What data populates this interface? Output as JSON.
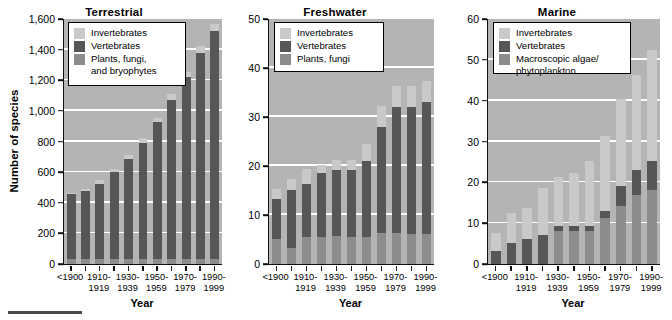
{
  "figure": {
    "y_axis_title": "Number of species",
    "x_axis_title": "Year",
    "colors": {
      "invertebrates": "#c9c9c9",
      "vertebrates": "#565656",
      "plants": "#8c8c8c",
      "plot_background": "#b4b4b4",
      "gridline": "#ffffff",
      "axis": "#111111"
    },
    "footer_rule_color": "#4a4a4a"
  },
  "chart_data": [
    {
      "type": "bar",
      "title": "Terrestrial",
      "xlabel": "Year",
      "ylabel": "Number of species",
      "ylim": [
        0,
        1600
      ],
      "yticks": [
        0,
        200,
        400,
        600,
        800,
        1000,
        1200,
        1400,
        1600
      ],
      "ytick_labels": [
        "0",
        "200",
        "400",
        "600",
        "800",
        "1,000",
        "1,200",
        "1,400",
        "1,600"
      ],
      "grid": true,
      "stacked": true,
      "legend_position": "upper left",
      "categories": [
        "<1900",
        "",
        "1910-\n1919",
        "",
        "1930-\n1939",
        "",
        "1950-\n1959",
        "",
        "1970-\n1979",
        "",
        "1990-\n1999"
      ],
      "bar_labels": [
        "<1900",
        "1910-\n1919",
        "1930-\n1939",
        "1950-\n1959",
        "1970-\n1979",
        "1990-\n1999"
      ],
      "x": [
        "<1900",
        "1910-1919",
        "1930-1939",
        "1950-1959",
        "1970-1979",
        "1990-1999"
      ],
      "series": [
        {
          "name": "Plants, fungi, and bryophytes",
          "values": [
            30,
            30,
            30,
            30,
            30,
            30,
            30,
            30
          ]
        },
        {
          "name": "Vertebrates",
          "values": [
            425,
            455,
            505,
            580,
            660,
            765,
            900,
            1035
          ]
        },
        {
          "name": "Invertebrates",
          "values": [
            10,
            10,
            25,
            30,
            30,
            35,
            40,
            45
          ]
        }
      ],
      "bar_x_values": [
        "<1900",
        "1905-1909",
        "1910-1919",
        "1920-1929",
        "1930-1939",
        "1940-1949",
        "1950-1959",
        "1960-1969"
      ],
      "bars": [
        {
          "label": "<1900",
          "plants": 30,
          "vertebrates": 425,
          "invertebrates": 10,
          "total": 465
        },
        {
          "label": "",
          "plants": 30,
          "vertebrates": 450,
          "invertebrates": 10,
          "total": 490
        },
        {
          "label": "1910-1919",
          "plants": 30,
          "vertebrates": 495,
          "invertebrates": 25,
          "total": 550
        },
        {
          "label": "",
          "plants": 30,
          "vertebrates": 570,
          "invertebrates": 20,
          "total": 620
        },
        {
          "label": "1930-1939",
          "plants": 30,
          "vertebrates": 655,
          "invertebrates": 25,
          "total": 710
        },
        {
          "label": "",
          "plants": 30,
          "vertebrates": 760,
          "invertebrates": 35,
          "total": 825
        },
        {
          "label": "1950-1959",
          "plants": 30,
          "vertebrates": 900,
          "invertebrates": 25,
          "total": 955
        },
        {
          "label": "",
          "plants": 30,
          "vertebrates": 1040,
          "invertebrates": 40,
          "total": 1110
        },
        {
          "label": "1970-1979",
          "plants": 30,
          "vertebrates": 1190,
          "invertebrates": 35,
          "total": 1255
        },
        {
          "label": "",
          "plants": 30,
          "vertebrates": 1350,
          "invertebrates": 45,
          "total": 1425
        },
        {
          "label": "1990-1999",
          "plants": 30,
          "vertebrates": 1490,
          "invertebrates": 45,
          "total": 1565
        }
      ],
      "legend": [
        {
          "key": "invertebrates",
          "label": "Invertebrates"
        },
        {
          "key": "vertebrates",
          "label": "Vertebrates"
        },
        {
          "key": "plants",
          "label": "Plants, fungi,\nand bryophytes"
        }
      ]
    },
    {
      "type": "bar",
      "title": "Freshwater",
      "xlabel": "Year",
      "ylabel": "",
      "ylim": [
        0,
        50
      ],
      "yticks": [
        0,
        10,
        20,
        30,
        40,
        50
      ],
      "ytick_labels": [
        "0",
        "10",
        "20",
        "30",
        "40",
        "50"
      ],
      "grid": true,
      "stacked": true,
      "legend_position": "upper left",
      "bar_labels": [
        "<1900",
        "1910-\n1919",
        "1930-\n1939",
        "1950-\n1959",
        "1970-\n1979",
        "1990-\n1999"
      ],
      "bars": [
        {
          "label": "<1900",
          "plants": 5.2,
          "vertebrates": 8.0,
          "invertebrates": 2.2,
          "total": 15.4
        },
        {
          "label": "",
          "plants": 3.2,
          "vertebrates": 11.9,
          "invertebrates": 2.3,
          "total": 17.4
        },
        {
          "label": "1910-1919",
          "plants": 5.5,
          "vertebrates": 10.8,
          "invertebrates": 3.1,
          "total": 19.4
        },
        {
          "label": "",
          "plants": 5.6,
          "vertebrates": 12.9,
          "invertebrates": 1.8,
          "total": 20.3
        },
        {
          "label": "1930-1939",
          "plants": 5.7,
          "vertebrates": 13.4,
          "invertebrates": 2.1,
          "total": 21.2
        },
        {
          "label": "",
          "plants": 5.6,
          "vertebrates": 13.5,
          "invertebrates": 2.1,
          "total": 21.2
        },
        {
          "label": "1950-1959",
          "plants": 5.5,
          "vertebrates": 15.5,
          "invertebrates": 3.4,
          "total": 24.4
        },
        {
          "label": "",
          "plants": 6.4,
          "vertebrates": 21.6,
          "invertebrates": 4.2,
          "total": 32.2
        },
        {
          "label": "1970-1979",
          "plants": 6.3,
          "vertebrates": 25.7,
          "invertebrates": 4.3,
          "total": 36.3
        },
        {
          "label": "",
          "plants": 6.2,
          "vertebrates": 25.9,
          "invertebrates": 4.2,
          "total": 36.3
        },
        {
          "label": "1990-1999",
          "plants": 6.2,
          "vertebrates": 26.9,
          "invertebrates": 4.3,
          "total": 37.4
        }
      ],
      "legend": [
        {
          "key": "invertebrates",
          "label": "Invertebrates"
        },
        {
          "key": "vertebrates",
          "label": "Vertebrates"
        },
        {
          "key": "plants",
          "label": "Plants, fungi"
        }
      ]
    },
    {
      "type": "bar",
      "title": "Marine",
      "xlabel": "Year",
      "ylabel": "",
      "ylim": [
        0,
        60
      ],
      "yticks": [
        0,
        10,
        20,
        30,
        40,
        50,
        60
      ],
      "ytick_labels": [
        "0",
        "10",
        "20",
        "30",
        "40",
        "50",
        "60"
      ],
      "grid": true,
      "stacked": true,
      "legend_position": "upper left",
      "bar_labels": [
        "<1900",
        "1910-\n1919",
        "1930-\n1939",
        "1950-\n1959",
        "1970-\n1979",
        "1990-\n1999"
      ],
      "bars": [
        {
          "label": "<1900",
          "plants": 0.0,
          "vertebrates": 3.2,
          "invertebrates": 4.3,
          "total": 7.5
        },
        {
          "label": "",
          "plants": 0.0,
          "vertebrates": 5.1,
          "invertebrates": 7.4,
          "total": 12.5
        },
        {
          "label": "1910-1919",
          "plants": 0.0,
          "vertebrates": 6.2,
          "invertebrates": 7.4,
          "total": 13.6
        },
        {
          "label": "",
          "plants": 0.0,
          "vertebrates": 7.1,
          "invertebrates": 11.4,
          "total": 18.5
        },
        {
          "label": "1930-1939",
          "plants": 8.2,
          "vertebrates": 1.1,
          "invertebrates": 12.1,
          "total": 21.4
        },
        {
          "label": "",
          "plants": 8.2,
          "vertebrates": 1.0,
          "invertebrates": 13.2,
          "total": 22.4
        },
        {
          "label": "1950-1959",
          "plants": 8.2,
          "vertebrates": 1.0,
          "invertebrates": 16.1,
          "total": 25.3
        },
        {
          "label": "",
          "plants": 11.2,
          "vertebrates": 1.8,
          "invertebrates": 18.4,
          "total": 31.4
        },
        {
          "label": "1970-1979",
          "plants": 14.1,
          "vertebrates": 5.0,
          "invertebrates": 21.3,
          "total": 40.4
        },
        {
          "label": "",
          "plants": 17.0,
          "vertebrates": 6.1,
          "invertebrates": 23.3,
          "total": 46.4
        },
        {
          "label": "1990-1999",
          "plants": 18.2,
          "vertebrates": 7.0,
          "invertebrates": 27.2,
          "total": 52.4
        }
      ],
      "legend": [
        {
          "key": "invertebrates",
          "label": "Invertebrates"
        },
        {
          "key": "vertebrates",
          "label": "Vertebrates"
        },
        {
          "key": "plants",
          "label": "Macroscopic algae/\nphytoplankton"
        }
      ]
    }
  ]
}
